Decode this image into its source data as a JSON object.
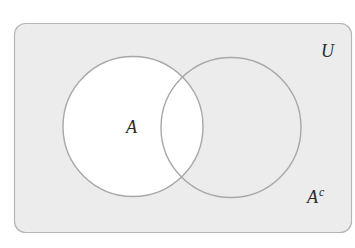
{
  "diagram": {
    "type": "venn",
    "title": "",
    "universe": {
      "label": "U",
      "fill": "#ececec",
      "stroke": "#b5b5b5"
    },
    "sets": [
      {
        "id": "A",
        "label": "A",
        "shaded": false,
        "fill": "#ffffff",
        "stroke": "#a8a8a8"
      },
      {
        "id": "B",
        "label": "",
        "shaded": true,
        "fill": "#ececec",
        "stroke": "#a8a8a8"
      }
    ],
    "complement_label": {
      "base": "A",
      "superscript": "c"
    },
    "highlighted_region": "complement of A (A^c) shaded gray; A left white"
  }
}
